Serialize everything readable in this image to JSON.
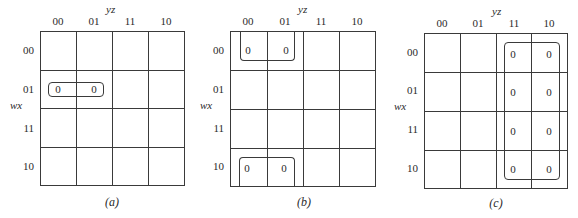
{
  "labels": {
    "col_var": "yz",
    "row_var": "wx",
    "col_headers": [
      "00",
      "01",
      "11",
      "10"
    ],
    "row_headers": [
      "00",
      "01",
      "11",
      "10"
    ]
  },
  "maps": [
    {
      "caption": "(a)",
      "cells": [
        {
          "row": "01",
          "col": "00",
          "value": "0"
        },
        {
          "row": "01",
          "col": "01",
          "value": "0"
        }
      ],
      "groups": [
        "row 01, cols 00-01"
      ]
    },
    {
      "caption": "(b)",
      "cells": [
        {
          "row": "00",
          "col": "00",
          "value": "0"
        },
        {
          "row": "00",
          "col": "01",
          "value": "0"
        },
        {
          "row": "10",
          "col": "00",
          "value": "0"
        },
        {
          "row": "10",
          "col": "01",
          "value": "0"
        }
      ],
      "groups": [
        "rows 00 & 10 (wrap-around), cols 00-01"
      ]
    },
    {
      "caption": "(c)",
      "cells": [
        {
          "row": "00",
          "col": "11",
          "value": "0"
        },
        {
          "row": "00",
          "col": "10",
          "value": "0"
        },
        {
          "row": "01",
          "col": "11",
          "value": "0"
        },
        {
          "row": "01",
          "col": "10",
          "value": "0"
        },
        {
          "row": "11",
          "col": "11",
          "value": "0"
        },
        {
          "row": "11",
          "col": "10",
          "value": "0"
        },
        {
          "row": "10",
          "col": "11",
          "value": "0"
        },
        {
          "row": "10",
          "col": "10",
          "value": "0"
        }
      ],
      "groups": [
        "all rows, cols 11-10"
      ]
    }
  ]
}
